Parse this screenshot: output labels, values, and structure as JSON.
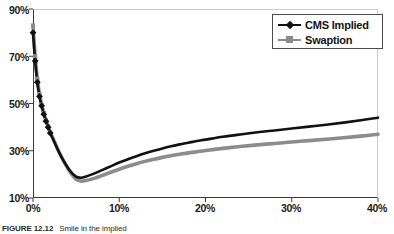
{
  "figure": {
    "caption_label": "FIGURE 12.12",
    "caption_text": "Smile in the implied"
  },
  "legend": {
    "position": "top-right",
    "items": [
      {
        "label": "CMS Implied",
        "color": "#111111",
        "marker": "diamond-marker"
      },
      {
        "label": "Swaption",
        "color": "#8c8c8c",
        "marker": "square-marker"
      }
    ]
  },
  "axes": {
    "x_ticks": [
      "0%",
      "10%",
      "20%",
      "30%",
      "40%"
    ],
    "y_ticks": [
      "90%",
      "70%",
      "50%",
      "30%",
      "10%"
    ],
    "xlabel": "",
    "ylabel": ""
  },
  "chart_data": {
    "type": "line",
    "title": "",
    "xlabel": "",
    "ylabel": "",
    "xlim": [
      0,
      40
    ],
    "ylim": [
      10,
      90
    ],
    "x_ticks": [
      0,
      10,
      20,
      30,
      40
    ],
    "y_ticks": [
      10,
      30,
      50,
      70,
      90
    ],
    "x_tick_labels": [
      "0%",
      "10%",
      "20%",
      "30%",
      "40%"
    ],
    "y_tick_labels": [
      "10%",
      "30%",
      "50%",
      "70%",
      "90%"
    ],
    "grid": false,
    "legend_position": "top-right",
    "x": [
      0,
      0.25,
      0.5,
      0.75,
      1,
      1.25,
      1.5,
      1.75,
      2,
      2.5,
      3,
      3.5,
      4,
      4.5,
      5,
      5.5,
      6,
      7,
      8,
      9,
      10,
      11,
      12,
      13,
      14,
      15,
      16,
      17,
      18,
      19,
      20,
      22,
      24,
      26,
      28,
      30,
      32,
      34,
      36,
      38,
      40
    ],
    "series": [
      {
        "name": "CMS Implied",
        "color": "#111111",
        "marker": "diamond",
        "values": [
          80.0,
          68.0,
          59.0,
          53.0,
          49.0,
          45.5,
          42.5,
          40.0,
          37.5,
          33.5,
          29.5,
          26.0,
          23.0,
          20.6,
          19.0,
          18.6,
          18.9,
          20.2,
          21.8,
          23.4,
          25.0,
          26.4,
          27.7,
          28.9,
          30.0,
          31.0,
          31.9,
          32.7,
          33.4,
          34.1,
          34.7,
          35.9,
          36.9,
          37.8,
          38.6,
          39.4,
          40.2,
          41.0,
          41.9,
          42.9,
          44.0
        ]
      },
      {
        "name": "Swaption",
        "color": "#8c8c8c",
        "marker": "square",
        "values": [
          83.0,
          70.0,
          60.5,
          54.0,
          49.5,
          46.0,
          43.0,
          40.3,
          37.8,
          33.7,
          29.6,
          26.0,
          22.8,
          20.0,
          17.9,
          17.2,
          17.3,
          18.2,
          19.5,
          20.9,
          22.2,
          23.4,
          24.5,
          25.5,
          26.4,
          27.2,
          27.9,
          28.5,
          29.1,
          29.6,
          30.1,
          31.0,
          31.8,
          32.5,
          33.1,
          33.7,
          34.3,
          34.9,
          35.5,
          36.2,
          37.0
        ]
      }
    ]
  }
}
